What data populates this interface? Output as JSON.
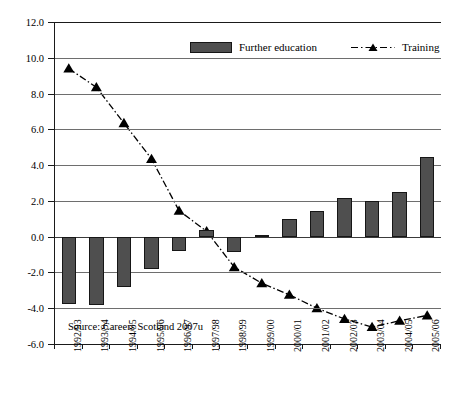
{
  "chart_data": {
    "type": "bar",
    "title": "",
    "xlabel": "",
    "ylabel": "",
    "ylim": [
      -6.0,
      12.0
    ],
    "ytick_step": 2.0,
    "yticks": [
      "12.0",
      "10.0",
      "8.0",
      "6.0",
      "4.0",
      "2.0",
      "0.0",
      "-2.0",
      "-4.0",
      "-6.0"
    ],
    "ytick_values": [
      12.0,
      10.0,
      8.0,
      6.0,
      4.0,
      2.0,
      0.0,
      -2.0,
      -4.0,
      -6.0
    ],
    "grid": true,
    "legend_position": "top-center-inside",
    "categories": [
      "1992/93",
      "1993/94",
      "1994/95",
      "1995/96",
      "1996/97",
      "1997/98",
      "1998/99",
      "1999/00",
      "2000/01",
      "2001/02",
      "2002/03",
      "2003/04",
      "2004/05",
      "2005/06"
    ],
    "series": [
      {
        "name": "Further education",
        "type": "bar",
        "color": "#4f4f4f",
        "values": [
          -3.75,
          -3.8,
          -2.8,
          -1.8,
          -0.8,
          0.35,
          -0.85,
          0.1,
          1.0,
          1.45,
          2.15,
          2.0,
          2.5,
          4.45
        ]
      },
      {
        "name": "Training",
        "type": "line",
        "color": "#000000",
        "marker": "triangle",
        "linestyle": "dash-dot",
        "values": [
          9.4,
          8.35,
          6.35,
          4.35,
          1.45,
          0.3,
          -1.7,
          -2.6,
          -3.25,
          -4.0,
          -4.6,
          -5.05,
          -4.7,
          -4.4
        ]
      }
    ],
    "annotations": [
      {
        "name": "source",
        "text": "Source: Careers Scotland 2007u"
      }
    ]
  },
  "legend": {
    "items": [
      {
        "label": "Further education",
        "marker": "bar-swatch"
      },
      {
        "label": "Training",
        "marker": "dash-dot-triangle"
      }
    ]
  },
  "source_note": "Source: Careers Scotland 2007u"
}
